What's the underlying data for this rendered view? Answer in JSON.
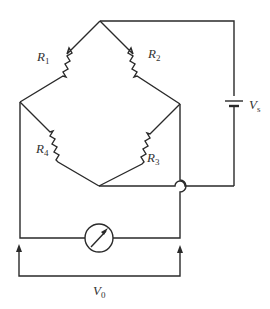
{
  "diagram": {
    "type": "wheatstone-bridge-circuit",
    "colors": {
      "line": "#2a2a2a",
      "text": "#333333",
      "background": "#ffffff"
    },
    "components": {
      "R1": {
        "symbol": "R",
        "subscript": "1",
        "kind": "resistor"
      },
      "R2": {
        "symbol": "R",
        "subscript": "2",
        "kind": "resistor"
      },
      "R3": {
        "symbol": "R",
        "subscript": "3",
        "kind": "resistor"
      },
      "R4": {
        "symbol": "R",
        "subscript": "4",
        "kind": "resistor"
      },
      "Vs": {
        "symbol": "V",
        "subscript": "s",
        "kind": "voltage-source"
      },
      "V0": {
        "symbol": "V",
        "subscript": "0",
        "kind": "output-voltage"
      },
      "meter": {
        "kind": "galvanometer"
      }
    }
  }
}
